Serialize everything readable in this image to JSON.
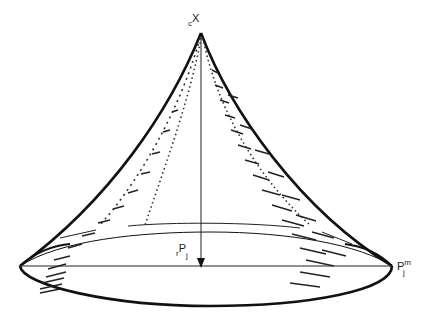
{
  "figure": {
    "type": "cusp-surface-diagram",
    "stroke_color": "#111111",
    "background": "#ffffff",
    "labels": {
      "apex": {
        "prefix": "c",
        "main": "X"
      },
      "radius": {
        "prefix": "r",
        "main": "P",
        "sub": "j"
      },
      "edge_point": {
        "main": "P",
        "sup": "m",
        "sub": "j"
      }
    }
  }
}
